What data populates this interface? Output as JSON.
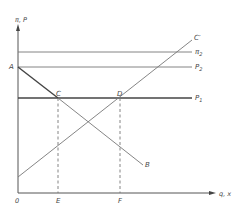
{
  "diagram": {
    "y_axis_label": "π, P",
    "x_axis_label": "q, x",
    "origin_label": "0",
    "points": {
      "A": "A",
      "B": "B",
      "C": "C",
      "D": "D",
      "E": "E",
      "F": "F",
      "C_prime": "C′"
    },
    "horizontal_lines": [
      {
        "label_main": "π",
        "label_sub": "2"
      },
      {
        "label_main": "P",
        "label_sub": "2"
      },
      {
        "label_main": "P",
        "label_sub": "1"
      }
    ]
  }
}
